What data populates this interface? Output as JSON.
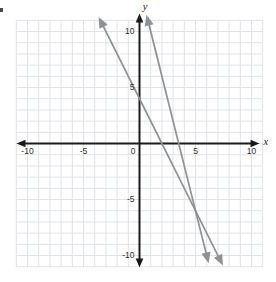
{
  "chart_data": {
    "type": "line",
    "title": "",
    "xlabel": "x",
    "ylabel": "y",
    "xlim": [
      -10,
      10
    ],
    "ylim": [
      -10,
      10
    ],
    "grid": true,
    "grid_spacing": 1,
    "grid_extent": 11,
    "x_tick_labels": [
      -10,
      -5,
      0,
      5,
      10
    ],
    "y_tick_labels": [
      10,
      5,
      -5,
      -10
    ],
    "series": [
      {
        "name": "line-1",
        "equation": "y = -2x + 4",
        "slope": -2,
        "y_intercept": 4,
        "x_intercept": 2,
        "points_on_line": [
          [
            -3,
            10
          ],
          [
            0,
            4
          ],
          [
            2,
            0
          ],
          [
            7,
            -10
          ]
        ],
        "drawn_y_range": [
          11.3,
          -10.9
        ],
        "arrowheads": "both",
        "color": "#8f9193"
      },
      {
        "name": "line-2",
        "equation": "y = -4x + 14",
        "slope": -4,
        "y_intercept": 14,
        "x_intercept": 3.5,
        "points_on_line": [
          [
            1,
            10
          ],
          [
            3.5,
            0
          ],
          [
            6,
            -10
          ]
        ],
        "drawn_y_range": [
          11.5,
          -10.7
        ],
        "arrowheads": "both",
        "color": "#8f9193"
      }
    ],
    "intersection_point": [
      5,
      -6
    ],
    "legend": null,
    "colors": {
      "axis": "#1a1a1a",
      "grid": "#e0e3e6",
      "tick_label": "#2e2e2e",
      "axis_letter": "#222222",
      "background": "#ffffff"
    }
  }
}
